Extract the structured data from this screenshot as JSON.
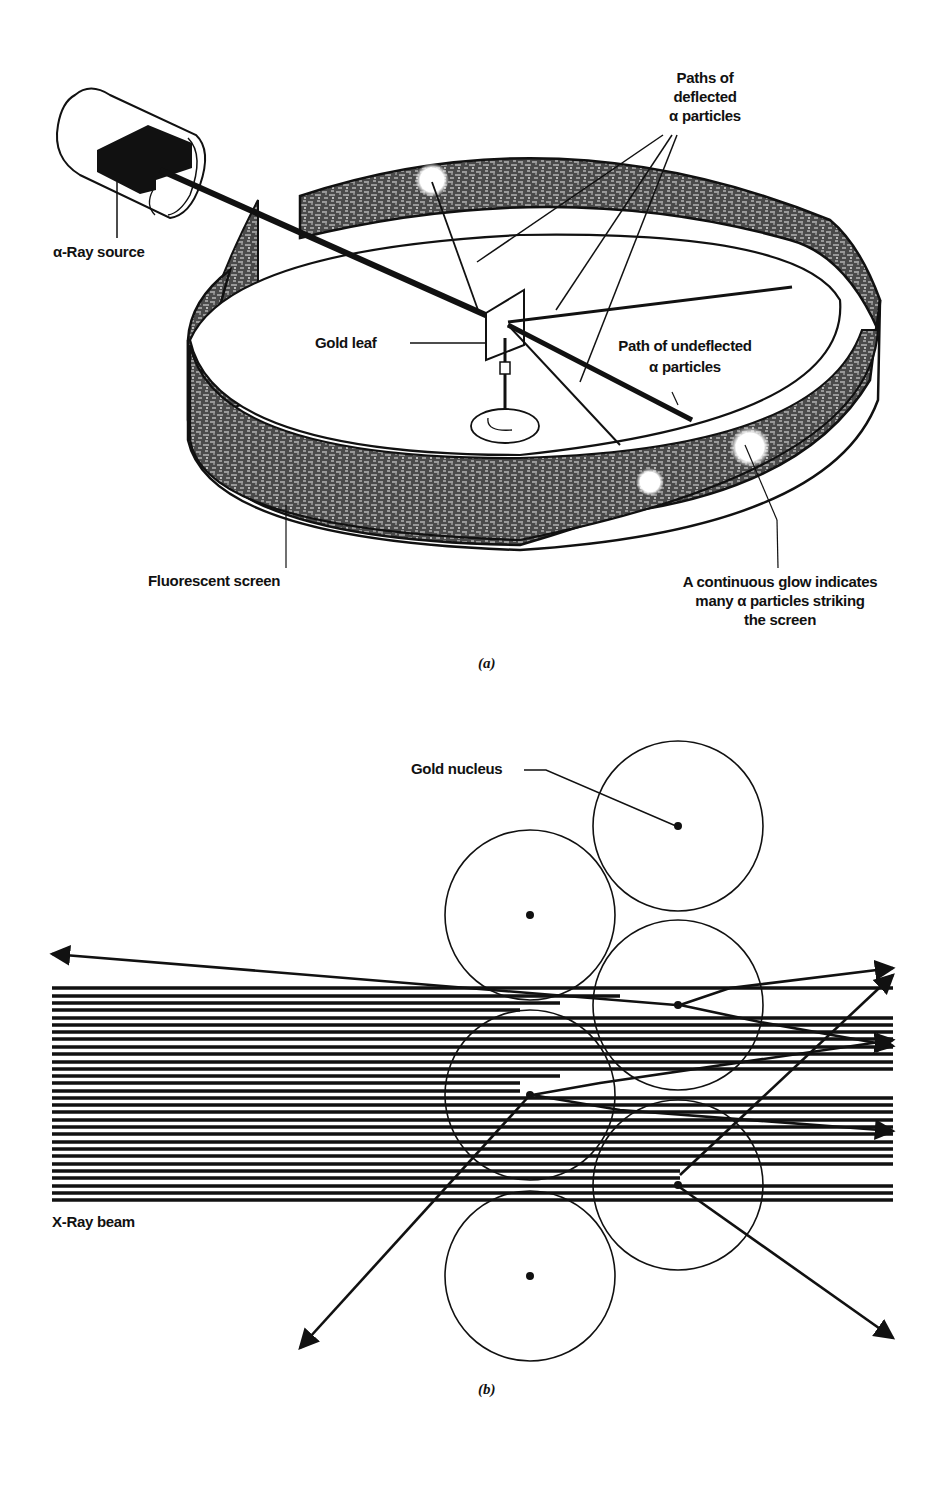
{
  "figure": {
    "panel_a": {
      "caption": "(a)",
      "labels": {
        "source": "α-Ray source",
        "deflected_line1": "Paths of",
        "deflected_line2": "deflected",
        "deflected_line3": "α particles",
        "gold_leaf": "Gold leaf",
        "undeflected_line1": "Path of undeflected",
        "undeflected_line2": "α particles",
        "screen": "Fluorescent screen",
        "glow_line1": "A continuous glow indicates",
        "glow_line2": "many α particles striking",
        "glow_line3": "the screen"
      }
    },
    "panel_b": {
      "caption": "(b)",
      "labels": {
        "nucleus": "Gold nucleus",
        "beam": "X-Ray beam"
      },
      "nucleus_count": 6,
      "beam_line_count": 30
    },
    "colors": {
      "ink": "#111111",
      "paper": "#ffffff",
      "stipple": "#2a2a2a"
    }
  }
}
